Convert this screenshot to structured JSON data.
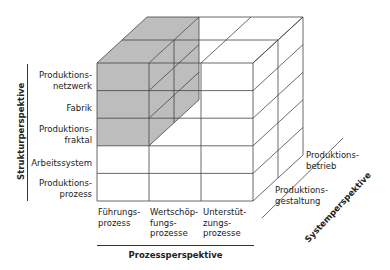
{
  "structure_axis": {
    "title": "Strukturperspektive",
    "levels": [
      "Produktions-\nnetzwerk",
      "Fabrik",
      "Produktions-\nfraktal",
      "Arbeitssystem",
      "Produktions-\nprozess"
    ]
  },
  "process_axis": {
    "title": "Prozessperspektive",
    "levels": [
      "Führungs-\nprozess",
      "Wertschöp-\nfungs-\nprozesse",
      "Unterstüt-\nzungs-\nprozesse"
    ]
  },
  "system_axis": {
    "title": "Systemperspektive",
    "levels": [
      "Produktions-\ngestaltung",
      "Produktions-\nbetrieb"
    ]
  },
  "colors": {
    "highlight": "#bdbdbd",
    "line": "#444444"
  }
}
